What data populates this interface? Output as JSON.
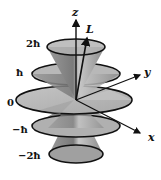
{
  "diagram": {
    "axes": {
      "z": "z",
      "y": "y",
      "x": "x",
      "vector": "L"
    },
    "levels": [
      {
        "label": "2ħ",
        "m": 2
      },
      {
        "label": "ħ",
        "m": 1
      },
      {
        "label": "0",
        "m": 0
      },
      {
        "label": "−ħ",
        "m": -1
      },
      {
        "label": "−2ħ",
        "m": -2
      }
    ],
    "colors": {
      "disk_fill": "#b4b4b4",
      "cone_fill": "#8c8c8c",
      "outline": "#111111",
      "background": "#ffffff"
    }
  }
}
